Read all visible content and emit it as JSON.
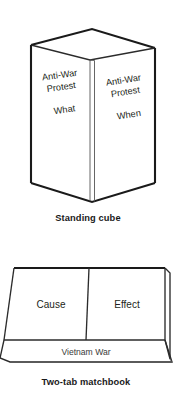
{
  "page": {
    "background_color": "#ffffff",
    "ink_color": "#1a1a1a",
    "text_color": "#231f20"
  },
  "figures": [
    {
      "id": "standing-cube",
      "caption": "Standing cube",
      "type": "open-top-box-foldable",
      "faces": [
        {
          "position": "left-front",
          "heading": "Anti-War\nProtest",
          "heading_line1": "Anti-War",
          "heading_line2": "Protest",
          "label": "What",
          "text_rotation_deg": -8
        },
        {
          "position": "right-front",
          "heading": "Anti-War\nProtest",
          "heading_line1": "Anti-War",
          "heading_line2": "Protest",
          "label": "When",
          "text_rotation_deg": -9
        }
      ]
    },
    {
      "id": "two-tab-matchbook",
      "caption": "Two-tab matchbook",
      "type": "two-tab-foldable",
      "tabs": [
        {
          "position": "left",
          "label": "Cause"
        },
        {
          "position": "right",
          "label": "Effect"
        }
      ],
      "base_label": "Vietnam War"
    }
  ]
}
